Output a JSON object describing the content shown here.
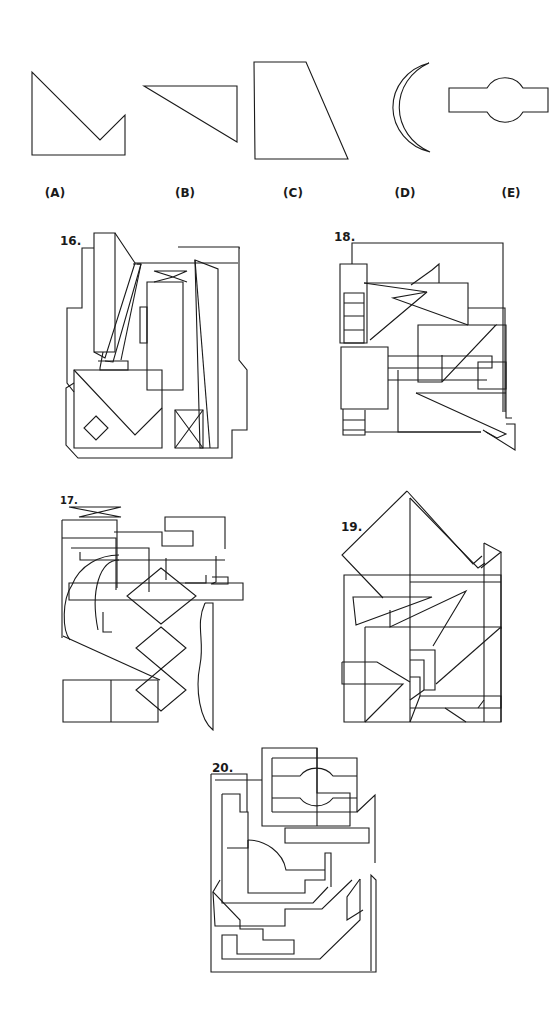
{
  "answer_choices": [
    {
      "id": "A",
      "label": "(A)",
      "label_pos": [
        55,
        186
      ],
      "paths": [
        "M32,72 L32,155 L125,155 L125,115 L100,140 Z"
      ]
    },
    {
      "id": "B",
      "label": "(B)",
      "label_pos": [
        185,
        186
      ],
      "paths": [
        "M144,86 L237,86 L237,142 Z"
      ]
    },
    {
      "id": "C",
      "label": "(C)",
      "label_pos": [
        293,
        186
      ],
      "paths": [
        "M254,62 L306,62 L348,159 L255,159 Z"
      ]
    },
    {
      "id": "D",
      "label": "(D)",
      "label_pos": [
        405,
        186
      ],
      "paths": [
        "M429,63 A52,49 0 0 0 430,152 A49,46 0 0 1 429,63 Z"
      ]
    },
    {
      "id": "E",
      "label": "(E)",
      "label_pos": [
        511,
        186
      ],
      "paths": [
        "M449,88 L487,88 A21,21 0 0 1 523,88 L548,88 L548,112 L523,112 A21,21 0 0 1 487,112 L449,112 Z"
      ]
    }
  ],
  "problems": [
    {
      "number": "16.",
      "number_pos": [
        60,
        234
      ],
      "small": false,
      "paths": [
        "M94,233 L115,233 L115,352 L94,352 Z",
        "M115,233 L135,263 L105,358 L94,352",
        "M94,248 L82,248 L82,308 L67,308 L67,383 L74,392",
        "M135,263 L238,263",
        "M133,264 L141,264 L113,362 L105,361",
        "M137,264 L141,264",
        "M98,361 L128,361 L128,370 L100,370 L100,368",
        "M100,368 L103,352",
        "M141,264 L121,360",
        "M147,282 L183,282 L183,390 L147,390 Z",
        "M140,307 L147,307 L147,343 L140,343 Z",
        "M154,271 L187,271 L173,277 L187,282 M154,271 L173,277 L154,282",
        "M195,260 L218,269 L218,448 L200,448 Z",
        "M195,260 L210,448",
        "M240,248 L239,248 M178,247 L239,247 L239,360 L247,370 L247,430 L232,430 L232,448",
        "M74,370 L162,370 L162,448 L74,448 Z",
        "M74,370 L135,435 L162,408",
        "M96,416 L108,428 L96,440 L84,428 Z",
        "M175,410 L203,410 L203,448 L175,448 Z",
        "M175,410 L203,448 M203,410 L175,448",
        "M74,383 L66,388 L66,445 L78,458 L232,458 L232,448"
      ]
    },
    {
      "number": "18.",
      "number_pos": [
        334,
        230
      ],
      "small": false,
      "paths": [
        "M352,264 L352,243 L503,243 L503,412",
        "M340,264 L367,264 L367,343 L340,343 Z",
        "M344,293 L364,293 L364,343 L344,343 Z",
        "M344,303 L364,303 M344,316 L364,316 M344,330 L364,330",
        "M364,283 L427,292 L393,298 L468,325",
        "M364,283 L468,283 L468,325",
        "M427,292 L370,340 M432,270 L439,264 L439,283",
        "M411,285 L432,270",
        "M468,308 L505,308 L505,412",
        "M418,325 L496,325 L442,382 L418,382 Z",
        "M496,325 L506,325 L506,418 L512,418",
        "M442,355 L442,382",
        "M341,347 L388,347 L388,409 L341,409 Z",
        "M388,356 L492,356 L492,368 L388,368",
        "M388,380 L487,380",
        "M398,370 L398,432 L481,432",
        "M478,362 L506,362 L506,389 L478,389 Z",
        "M416,393 L506,434 L497,438 L486,432",
        "M416,393 L506,393",
        "M343,409 L343,435 L365,435 L365,410",
        "M343,420 L365,420 M343,430 L365,430",
        "M365,432 L481,432",
        "M483,430 L515,450 L515,424 L506,424"
      ]
    },
    {
      "number": "17.",
      "number_pos": [
        60,
        495
      ],
      "small": true,
      "paths": [
        "M69,507 L121,507 L79,517 L121,517 L69,507",
        "M62,520 L117,520 L117,588",
        "M62,520 L62,638",
        "M62,538 L116,538 L116,590",
        "M71,548 L149,548 L149,592",
        "M80,552 L80,560 L122,560",
        "M114,532 L162,532 L162,546 L193,546 L193,531 L165,531 L165,517 L225,517 L225,549",
        "M122,560 L225,560",
        "M216,556 L216,582 L211,584 L228,584 L228,577 L212,577",
        "M166,558 L166,580",
        "M206,575 L206,583 L185,583",
        "M69,583 L243,583 L243,600 L69,600 Z",
        "M161,568 L196,596 L161,624 L127,596 Z",
        "M161,627 L186,648 L161,669 L136,648 Z",
        "M161,669 L186,690 L161,711 L136,690 Z",
        "M119,555 C100,555 80,565 72,585 C62,600 62,630 70,640",
        "M119,560 C100,560 90,590 98,630",
        "M103,612 L103,632 L112,632",
        "M63,636 L160,680",
        "M205,603 L213,603 L213,730 C200,720 195,690 200,665 C205,640 195,625 205,603",
        "M63,680 L158,680 L158,722 L63,722 Z",
        "M111,680 L111,722"
      ]
    },
    {
      "number": "19.",
      "number_pos": [
        341,
        520
      ],
      "small": false,
      "paths": [
        "M407,491 L342,555 L383,598",
        "M407,491 L473,564 L482,556",
        "M410,498 L478,568 L485,563",
        "M410,498 L410,722",
        "M484,543 L501,552 L481,568",
        "M484,543 L484,722 M501,552 L501,722",
        "M344,575 L501,575 L501,722 L344,722 Z",
        "M410,582 L501,582",
        "M353,597 L432,597 L356,625 Z",
        "M390,610 L390,627 L466,591 L433,646",
        "M365,627 L501,627 L501,629",
        "M365,627 L365,722",
        "M410,650 L435,650 L435,690 L424,690 L424,660 L410,660",
        "M342,662 L377,662 L410,682 M342,662 L342,684 L403,684 L365,722",
        "M410,677 L420,677 L420,696 L501,696 L501,708 L410,708",
        "M436,684 L501,627",
        "M445,708 L466,722 M478,708 L484,700",
        "M420,696 L410,722 M424,690 L410,700"
      ]
    },
    {
      "number": "20.",
      "number_pos": [
        212,
        761
      ],
      "small": false,
      "paths": [
        "M262,748 L317,748 L317,793 L350,793 L350,826 L262,826 Z",
        "M272,758 L357,758 L357,812 L272,812",
        "M272,776 L300,776 A20,18 0 0 1 333,776 L357,776",
        "M272,798 L300,798 A20,18 0 0 0 333,798 L357,798",
        "M317,748 L317,826",
        "M272,758 L272,812",
        "M357,812 L375,795 L375,863",
        "M285,828 L369,828 L369,843 L285,843 Z",
        "M211,774 L247,774 L247,812",
        "M215,780 L262,780",
        "M211,774 L211,972 L376,972 L376,880 L371,875 L371,971",
        "M222,794 L240,794 L240,812 L248,812 L248,848 L227,848",
        "M222,794 L222,903 L313,903 L328,887",
        "M248,840 L248,893 L305,893 L305,880 L325,880 L325,853 L331,853 L331,887",
        "M248,840 C265,840 283,852 286,870 L325,870",
        "M220,880 L213,892 L240,920 L240,929 L263,929 L263,940 L294,940 L294,954 L237,954 L237,935 L222,935 L222,959 L320,959 L360,920 L360,879",
        "M213,892 L215,926 L285,926 L285,909 L322,909 L352,880",
        "M360,879 L347,897 L347,920 L363,910"
      ]
    }
  ]
}
